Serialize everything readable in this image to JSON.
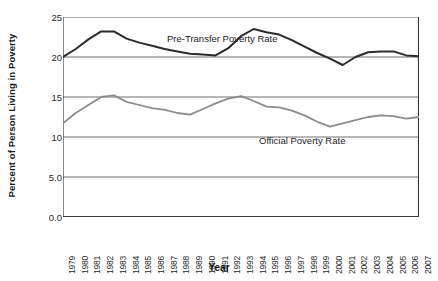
{
  "chart_data": {
    "type": "line",
    "title": "",
    "xlabel": "Year",
    "ylabel": "Percent of Person Living in Poverty",
    "ylim": [
      0,
      25
    ],
    "ytick_labels": [
      "0.0",
      "5.0",
      "10",
      "15",
      "20",
      "25"
    ],
    "ytick_values": [
      0,
      5,
      10,
      15,
      20,
      25
    ],
    "grid": true,
    "legend": "inline-labels",
    "categories": [
      "1979",
      "1980",
      "1981",
      "1982",
      "1983",
      "1984",
      "1985",
      "1986",
      "1987",
      "1988",
      "1989",
      "1990",
      "1991",
      "1992",
      "1993",
      "1994",
      "1995",
      "1996",
      "1997",
      "1998",
      "1999",
      "2000",
      "2001",
      "2002",
      "2003",
      "2004",
      "2005",
      "2006",
      "2007"
    ],
    "series": [
      {
        "name": "Pre-Transfer Poverty Rate",
        "color": "#2b2b2b",
        "values": [
          20.0,
          21.0,
          22.2,
          23.2,
          23.2,
          22.3,
          21.8,
          21.4,
          21.0,
          20.7,
          20.4,
          20.3,
          20.2,
          21.1,
          22.6,
          23.5,
          23.1,
          22.8,
          22.1,
          21.3,
          20.5,
          19.8,
          19.0,
          20.0,
          20.6,
          20.7,
          20.7,
          20.2,
          20.1
        ]
      },
      {
        "name": "Official Poverty Rate",
        "color": "#8c8c8c",
        "values": [
          11.7,
          13.0,
          14.0,
          15.0,
          15.2,
          14.4,
          14.0,
          13.6,
          13.4,
          13.0,
          12.8,
          13.5,
          14.2,
          14.8,
          15.1,
          14.5,
          13.8,
          13.7,
          13.3,
          12.7,
          11.9,
          11.3,
          11.7,
          12.1,
          12.5,
          12.7,
          12.6,
          12.3,
          12.5
        ]
      }
    ],
    "annotations": [
      {
        "text": "Pre-Transfer Poverty Rate",
        "series": 0
      },
      {
        "text": "Official Poverty Rate",
        "series": 1
      }
    ]
  }
}
